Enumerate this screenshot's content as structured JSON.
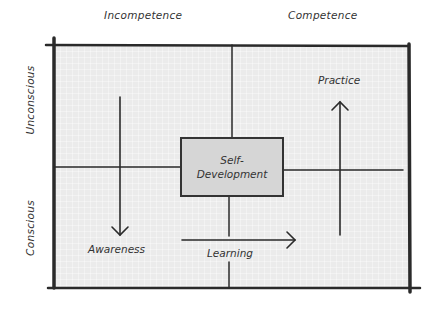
{
  "diagram": {
    "type": "competence-matrix",
    "columns": [
      {
        "label": "Incompetence"
      },
      {
        "label": "Competence"
      }
    ],
    "rows": [
      {
        "label": "Unconscious"
      },
      {
        "label": "Conscious"
      }
    ],
    "center_box": {
      "line1": "Self-",
      "line2": "Development"
    },
    "flows": [
      {
        "label": "Awareness",
        "direction": "down",
        "from": "Unconscious Incompetence",
        "to": "Conscious Incompetence"
      },
      {
        "label": "Learning",
        "direction": "right",
        "from": "Conscious Incompetence",
        "to": "Conscious Competence"
      },
      {
        "label": "Practice",
        "direction": "up",
        "from": "Conscious Competence",
        "to": "Unconscious Competence"
      }
    ],
    "colors": {
      "line": "#2a2a2a",
      "grid_fill": "#ebebeb",
      "box_fill": "#d6d6d6"
    }
  }
}
